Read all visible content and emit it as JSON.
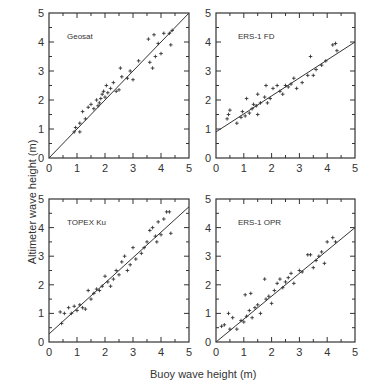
{
  "chart_data": [
    {
      "type": "scatter",
      "title": "Geosat",
      "xlabel": "Buoy wave height (m)",
      "ylabel": "Altimeter wave height (m)",
      "xlim": [
        0,
        5
      ],
      "ylim": [
        0,
        5
      ],
      "xticks": [
        0,
        1,
        2,
        3,
        4,
        5
      ],
      "yticks": [
        0,
        1,
        2,
        3,
        4,
        5
      ],
      "fit_line": {
        "intercept": 0.0,
        "slope": 1.0
      },
      "points": [
        [
          0.9,
          0.9
        ],
        [
          0.95,
          1.05
        ],
        [
          1.1,
          0.9
        ],
        [
          1.1,
          1.2
        ],
        [
          1.2,
          1.6
        ],
        [
          1.3,
          1.35
        ],
        [
          1.4,
          1.75
        ],
        [
          1.5,
          1.85
        ],
        [
          1.6,
          1.7
        ],
        [
          1.7,
          2.0
        ],
        [
          1.75,
          1.8
        ],
        [
          1.8,
          1.9
        ],
        [
          1.85,
          2.05
        ],
        [
          1.9,
          2.2
        ],
        [
          1.95,
          2.3
        ],
        [
          2.0,
          2.1
        ],
        [
          2.05,
          2.5
        ],
        [
          2.1,
          2.25
        ],
        [
          2.2,
          2.4
        ],
        [
          2.3,
          2.6
        ],
        [
          2.4,
          2.3
        ],
        [
          2.5,
          2.35
        ],
        [
          2.55,
          3.1
        ],
        [
          2.6,
          2.8
        ],
        [
          2.8,
          2.75
        ],
        [
          2.9,
          3.0
        ],
        [
          3.0,
          2.7
        ],
        [
          3.2,
          3.35
        ],
        [
          3.55,
          4.1
        ],
        [
          3.6,
          3.3
        ],
        [
          3.7,
          3.1
        ],
        [
          3.75,
          4.25
        ],
        [
          3.8,
          3.5
        ],
        [
          3.9,
          3.95
        ],
        [
          4.0,
          3.6
        ],
        [
          4.1,
          4.3
        ],
        [
          4.3,
          4.3
        ],
        [
          4.35,
          3.9
        ],
        [
          4.4,
          4.4
        ]
      ]
    },
    {
      "type": "scatter",
      "title": "ERS-1 FD",
      "xlim": [
        0,
        5
      ],
      "ylim": [
        0,
        5
      ],
      "xticks": [
        0,
        1,
        2,
        3,
        4,
        5
      ],
      "yticks": [
        0,
        1,
        2,
        3,
        4,
        5
      ],
      "fit_line": {
        "intercept": 0.9,
        "slope": 0.62
      },
      "points": [
        [
          0.4,
          1.35
        ],
        [
          0.45,
          1.5
        ],
        [
          0.5,
          1.65
        ],
        [
          0.75,
          1.2
        ],
        [
          0.9,
          1.4
        ],
        [
          0.95,
          1.6
        ],
        [
          1.05,
          1.45
        ],
        [
          1.1,
          2.05
        ],
        [
          1.2,
          1.55
        ],
        [
          1.3,
          1.7
        ],
        [
          1.35,
          1.85
        ],
        [
          1.45,
          1.8
        ],
        [
          1.5,
          1.5
        ],
        [
          1.5,
          2.2
        ],
        [
          1.6,
          1.9
        ],
        [
          1.75,
          2.1
        ],
        [
          1.8,
          2.5
        ],
        [
          1.85,
          1.9
        ],
        [
          1.95,
          2.05
        ],
        [
          2.05,
          2.4
        ],
        [
          2.2,
          2.5
        ],
        [
          2.3,
          2.3
        ],
        [
          2.4,
          2.2
        ],
        [
          2.5,
          2.5
        ],
        [
          2.6,
          2.45
        ],
        [
          2.7,
          2.55
        ],
        [
          2.8,
          2.75
        ],
        [
          2.9,
          2.4
        ],
        [
          3.1,
          2.6
        ],
        [
          3.3,
          2.85
        ],
        [
          3.4,
          3.5
        ],
        [
          3.5,
          2.85
        ],
        [
          3.6,
          3.05
        ],
        [
          3.8,
          3.2
        ],
        [
          3.95,
          3.35
        ],
        [
          4.2,
          3.9
        ],
        [
          4.3,
          3.95
        ],
        [
          4.35,
          3.7
        ]
      ]
    },
    {
      "type": "scatter",
      "title": "TOPEX Ku",
      "xlim": [
        0,
        5
      ],
      "ylim": [
        0,
        5
      ],
      "xticks": [
        0,
        1,
        2,
        3,
        4,
        5
      ],
      "yticks": [
        0,
        1,
        2,
        3,
        4,
        5
      ],
      "fit_line": {
        "intercept": 0.28,
        "slope": 0.89
      },
      "points": [
        [
          0.4,
          1.05
        ],
        [
          0.45,
          0.65
        ],
        [
          0.55,
          1.0
        ],
        [
          0.7,
          1.2
        ],
        [
          0.8,
          1.0
        ],
        [
          0.9,
          1.25
        ],
        [
          1.0,
          1.1
        ],
        [
          1.1,
          1.3
        ],
        [
          1.2,
          1.2
        ],
        [
          1.3,
          1.15
        ],
        [
          1.4,
          1.8
        ],
        [
          1.5,
          1.5
        ],
        [
          1.6,
          1.7
        ],
        [
          1.7,
          1.85
        ],
        [
          1.8,
          1.8
        ],
        [
          1.9,
          1.95
        ],
        [
          2.0,
          2.3
        ],
        [
          2.1,
          2.1
        ],
        [
          2.2,
          1.95
        ],
        [
          2.3,
          2.2
        ],
        [
          2.4,
          2.5
        ],
        [
          2.5,
          2.35
        ],
        [
          2.6,
          2.8
        ],
        [
          2.7,
          3.0
        ],
        [
          2.8,
          2.5
        ],
        [
          2.9,
          2.7
        ],
        [
          3.0,
          3.3
        ],
        [
          3.1,
          2.9
        ],
        [
          3.3,
          3.1
        ],
        [
          3.4,
          3.3
        ],
        [
          3.5,
          3.5
        ],
        [
          3.6,
          3.9
        ],
        [
          3.7,
          4.0
        ],
        [
          3.8,
          3.7
        ],
        [
          3.85,
          3.5
        ],
        [
          3.9,
          4.2
        ],
        [
          4.0,
          3.75
        ],
        [
          4.1,
          4.3
        ],
        [
          4.2,
          4.55
        ],
        [
          4.3,
          4.55
        ],
        [
          4.35,
          3.8
        ]
      ]
    },
    {
      "type": "scatter",
      "title": "ERS-1 OPR",
      "xlim": [
        0,
        5
      ],
      "ylim": [
        0,
        5
      ],
      "xticks": [
        0,
        1,
        2,
        3,
        4,
        5
      ],
      "yticks": [
        0,
        1,
        2,
        3,
        4,
        5
      ],
      "fit_line": {
        "intercept": 0.0,
        "slope": 0.8
      },
      "points": [
        [
          0.2,
          0.55
        ],
        [
          0.3,
          0.6
        ],
        [
          0.45,
          1.0
        ],
        [
          0.5,
          0.45
        ],
        [
          0.6,
          0.85
        ],
        [
          0.75,
          0.45
        ],
        [
          0.9,
          0.75
        ],
        [
          1.0,
          0.7
        ],
        [
          1.05,
          1.65
        ],
        [
          1.1,
          0.9
        ],
        [
          1.2,
          1.1
        ],
        [
          1.25,
          1.7
        ],
        [
          1.3,
          0.85
        ],
        [
          1.4,
          1.2
        ],
        [
          1.5,
          1.3
        ],
        [
          1.6,
          1.0
        ],
        [
          1.75,
          2.2
        ],
        [
          1.8,
          1.5
        ],
        [
          1.9,
          1.6
        ],
        [
          2.0,
          1.35
        ],
        [
          2.1,
          1.8
        ],
        [
          2.2,
          2.05
        ],
        [
          2.3,
          2.2
        ],
        [
          2.4,
          1.9
        ],
        [
          2.5,
          2.1
        ],
        [
          2.6,
          2.25
        ],
        [
          2.7,
          2.4
        ],
        [
          2.8,
          2.05
        ],
        [
          3.0,
          2.5
        ],
        [
          3.1,
          2.45
        ],
        [
          3.3,
          3.05
        ],
        [
          3.4,
          3.05
        ],
        [
          3.5,
          2.6
        ],
        [
          3.6,
          2.85
        ],
        [
          3.7,
          3.0
        ],
        [
          3.8,
          3.15
        ],
        [
          3.9,
          2.75
        ],
        [
          4.0,
          3.5
        ],
        [
          4.2,
          3.65
        ],
        [
          4.3,
          3.5
        ]
      ]
    }
  ],
  "axes": {
    "xlabel": "Buoy wave height (m)",
    "ylabel": "Altimeter wave height (m)"
  }
}
